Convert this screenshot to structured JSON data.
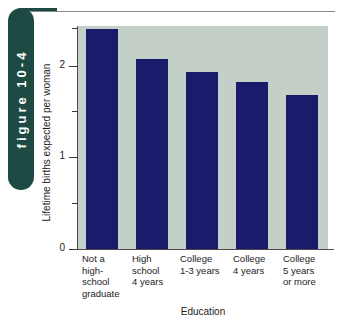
{
  "figure_tab": {
    "label": "figure 10-4",
    "background_color": "#1d4a42",
    "text_color": "#ffffff"
  },
  "colors": {
    "bar": "#1b1b6b",
    "plot_background": "#c3cfc7",
    "page_background": "#ffffff",
    "axis": "#4a4a4a",
    "tab_green": "#1d4a42"
  },
  "chart_data": {
    "type": "bar",
    "title": "",
    "subtitle": "",
    "xlabel": "Education",
    "ylabel": "Lifetime births expected per woman",
    "categories": [
      "Not a high-school graduate",
      "High school 4 years",
      "College 1-3 years",
      "College 4 years",
      "College 5 years or more"
    ],
    "category_lines": [
      [
        "Not a",
        "high-",
        "school",
        "graduate"
      ],
      [
        "High",
        "school",
        "4 years"
      ],
      [
        "College",
        "1-3 years"
      ],
      [
        "College",
        "4 years"
      ],
      [
        "College",
        "5 years",
        "or more"
      ]
    ],
    "values": [
      2.4,
      2.08,
      1.93,
      1.82,
      1.68
    ],
    "ylim": [
      0,
      2.5
    ],
    "xlim_note": "categorical",
    "y_major_ticks": [
      0,
      1,
      2
    ],
    "y_major_tick_labels": [
      "0",
      "1",
      "2"
    ],
    "y_minor_ticks": [
      0.5,
      1.5,
      2.5
    ],
    "grid": false,
    "legend": null,
    "legend_position": "none",
    "annotations": []
  }
}
